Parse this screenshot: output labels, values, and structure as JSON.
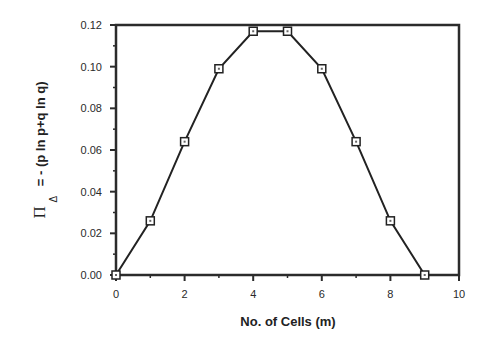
{
  "chart_data": {
    "type": "line",
    "title": "",
    "xlabel": "No. of Cells (m)",
    "ylabel": "Π_Δ = - (p ln p+q ln q)",
    "ylabel_parts": {
      "symbol": "Π",
      "subscript": "Δ",
      "rest": "= - (p ln p+q ln q)"
    },
    "xlim": [
      0,
      10
    ],
    "ylim": [
      0.0,
      0.12
    ],
    "x_ticks": [
      0,
      2,
      4,
      6,
      8,
      10
    ],
    "x_tick_labels": [
      "0",
      "2",
      "4",
      "6",
      "8",
      "10"
    ],
    "y_ticks": [
      0.0,
      0.02,
      0.04,
      0.06,
      0.08,
      0.1,
      0.12
    ],
    "y_tick_labels": [
      "0.00",
      "0.02",
      "0.04",
      "0.06",
      "0.08",
      "0.10",
      "0.12"
    ],
    "grid": false,
    "legend": null,
    "series": [
      {
        "name": "entropy",
        "marker": "open-square",
        "x": [
          0,
          1,
          2,
          3,
          4,
          5,
          6,
          7,
          8,
          9
        ],
        "values": [
          0.0,
          0.026,
          0.064,
          0.099,
          0.117,
          0.117,
          0.099,
          0.064,
          0.026,
          0.0
        ]
      }
    ]
  }
}
